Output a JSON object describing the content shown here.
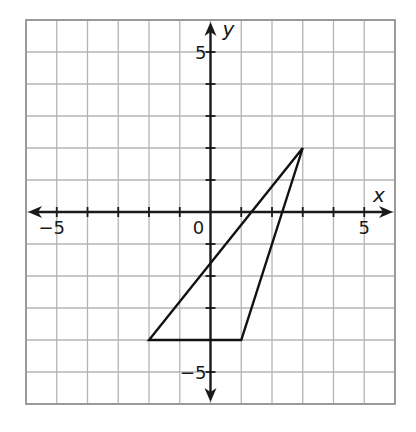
{
  "chart_data": {
    "type": "coordinate-grid",
    "title": "",
    "xlabel": "x",
    "ylabel": "y",
    "xlim": [
      -6,
      6
    ],
    "ylim": [
      -6,
      6
    ],
    "grid": true,
    "grid_step": 1,
    "x_tick_labels": [
      {
        "value": -5,
        "text": "−5"
      },
      {
        "value": 0,
        "text": "0"
      },
      {
        "value": 5,
        "text": "5"
      }
    ],
    "y_tick_labels": [
      {
        "value": 5,
        "text": "5"
      },
      {
        "value": -5,
        "text": "−5"
      }
    ],
    "shapes": [
      {
        "type": "triangle",
        "vertices": [
          [
            3,
            2
          ],
          [
            -2,
            -4
          ],
          [
            1,
            -4
          ]
        ]
      }
    ]
  },
  "colors": {
    "grid": "#b4b4b4",
    "border": "#9a9a9a",
    "axis": "#1a1a1a",
    "shape": "#111111",
    "background": "#ffffff"
  }
}
